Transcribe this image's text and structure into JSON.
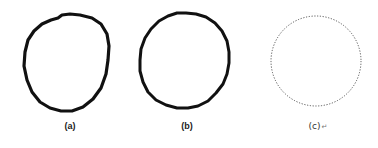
{
  "figure": {
    "panels": [
      {
        "id": "a",
        "label": "(a)",
        "description": "irregular hand-drawn closed contour, thick black stroke"
      },
      {
        "id": "b",
        "label": "(b)",
        "description": "near-circular hand-drawn closed contour, thick black stroke"
      },
      {
        "id": "c",
        "label": "(c)",
        "description": "ideal circle, dotted gray outline"
      }
    ],
    "return_mark": "↵",
    "colors": {
      "stroke": "#111111",
      "dotted": "#555555",
      "background": "#ffffff"
    }
  }
}
